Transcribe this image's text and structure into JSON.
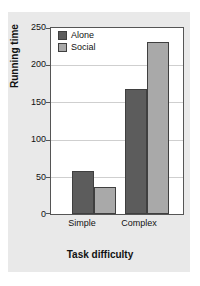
{
  "chart_data": {
    "type": "bar",
    "title": "",
    "xlabel": "Task difficulty",
    "ylabel": "Running time",
    "categories": [
      "Simple",
      "Complex"
    ],
    "series": [
      {
        "name": "Alone",
        "color": "#5c5c5c",
        "values": [
          58,
          168
        ]
      },
      {
        "name": "Social",
        "color": "#a9a9a9",
        "values": [
          36,
          231
        ]
      }
    ],
    "ylim": [
      0,
      250
    ],
    "yticks": [
      0,
      50,
      100,
      150,
      200,
      250
    ],
    "ytick_labels": [
      "0",
      "50",
      "100",
      "150",
      "200",
      "250"
    ],
    "grid": true,
    "grid_axis": "y",
    "legend_position": "top-left-inside",
    "background": "#e9e9e9",
    "plot_background": "#ffffff"
  },
  "axes": {
    "y_title": "Running time",
    "x_title": "Task difficulty",
    "y_ticks": [
      {
        "label": "250",
        "value": 250
      },
      {
        "label": "200",
        "value": 200
      },
      {
        "label": "150",
        "value": 150
      },
      {
        "label": "100",
        "value": 100
      },
      {
        "label": "50",
        "value": 50
      },
      {
        "label": "0",
        "value": 0
      }
    ],
    "x_ticks": [
      {
        "label": "Simple"
      },
      {
        "label": "Complex"
      }
    ]
  },
  "legend": {
    "entries": [
      {
        "label": "Alone",
        "color": "#5c5c5c"
      },
      {
        "label": "Social",
        "color": "#a9a9a9"
      }
    ]
  }
}
